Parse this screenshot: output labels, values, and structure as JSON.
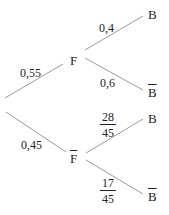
{
  "tree": {
    "root_branches": [
      {
        "node": "F",
        "negated": false,
        "probability": "0,55"
      },
      {
        "node": "F",
        "negated": true,
        "probability": "0,45"
      }
    ],
    "F_branches": [
      {
        "node": "B",
        "negated": false,
        "probability": "0,4"
      },
      {
        "node": "B",
        "negated": true,
        "probability": "0,6"
      }
    ],
    "Fbar_branches": [
      {
        "node": "B",
        "negated": false,
        "probability": {
          "num": "28",
          "den": "45"
        }
      },
      {
        "node": "B",
        "negated": true,
        "probability": {
          "num": "17",
          "den": "45"
        }
      }
    ]
  }
}
